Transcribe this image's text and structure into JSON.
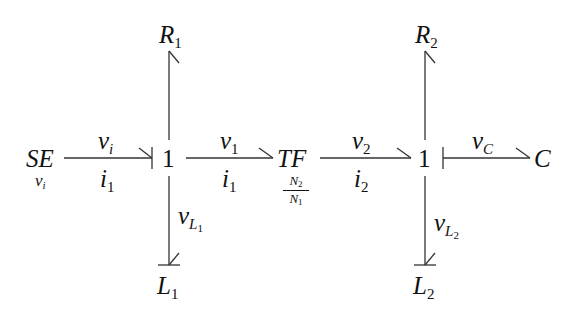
{
  "diagram": {
    "type": "bond-graph",
    "nodes": {
      "se": {
        "label": "SE",
        "sub_label": "v",
        "sub_label_index": "i"
      },
      "junction1": {
        "label": "1"
      },
      "tf": {
        "label": "TF",
        "ratio_num": "N",
        "ratio_num_index": "2",
        "ratio_den": "N",
        "ratio_den_index": "1"
      },
      "junction2": {
        "label": "1"
      },
      "c": {
        "label": "C"
      },
      "r1": {
        "label": "R",
        "index": "1"
      },
      "l1": {
        "label": "L",
        "index": "1"
      },
      "r2": {
        "label": "R",
        "index": "2"
      },
      "l2": {
        "label": "L",
        "index": "2"
      }
    },
    "bonds": {
      "se_j1": {
        "effort": "v",
        "effort_index": "i",
        "flow": "i",
        "flow_index": "1"
      },
      "j1_tf": {
        "effort": "v",
        "effort_index": "1",
        "flow": "i",
        "flow_index": "1"
      },
      "tf_j2": {
        "effort": "v",
        "effort_index": "2",
        "flow": "i",
        "flow_index": "2"
      },
      "j2_c": {
        "effort": "v",
        "effort_index": "C"
      },
      "j1_l1": {
        "effort": "v",
        "effort_index": "L",
        "effort_index_sub": "1"
      },
      "j2_l2": {
        "effort": "v",
        "effort_index": "L",
        "effort_index_sub": "2"
      },
      "j1_r1": {},
      "j2_r2": {}
    }
  }
}
